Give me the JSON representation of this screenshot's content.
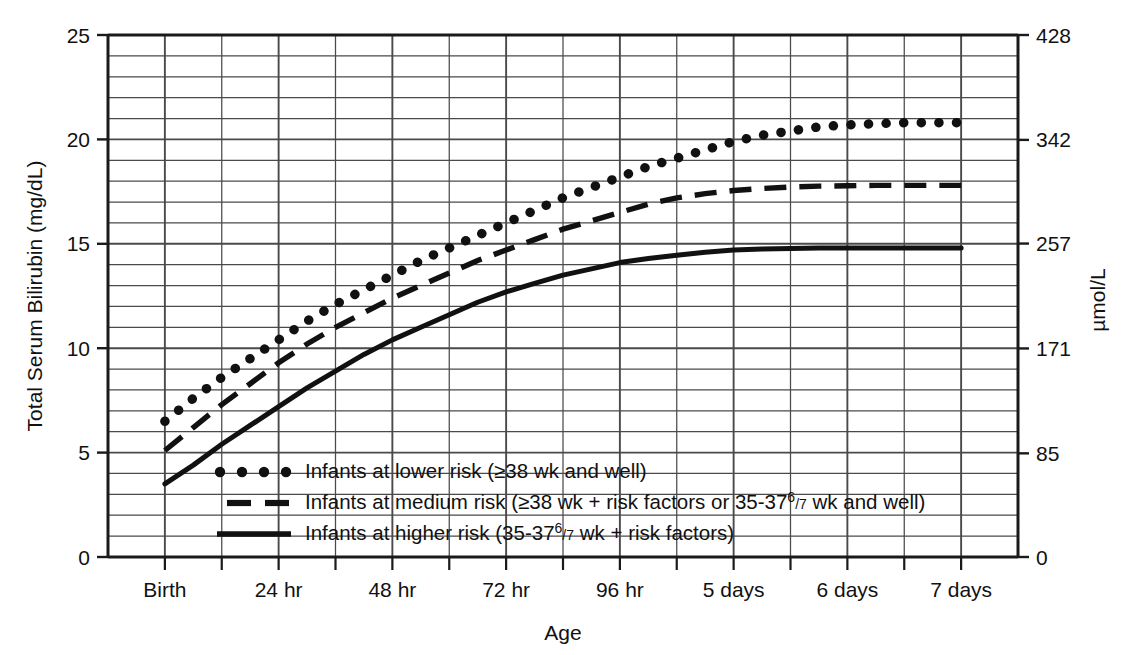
{
  "figure": {
    "background_color": "#ffffff",
    "ink_color": "#111111",
    "grid_color": "#4a4a4a",
    "axis_color": "#1a1a1a"
  },
  "chart_data": {
    "type": "line",
    "title": "",
    "xlabel": "Age",
    "ylabel": "Total Serum Bilirubin (mg/dL)",
    "y2label": "µmol/L",
    "grid": true,
    "legend_position": "inside-bottom-left",
    "xlim": [
      -12,
      180
    ],
    "ylim": [
      0,
      25
    ],
    "y2lim": [
      0,
      428
    ],
    "x_tick_labels": [
      "Birth",
      "24 hr",
      "48 hr",
      "72 hr",
      "96 hr",
      "5 days",
      "6 days",
      "7 days"
    ],
    "x_tick_values": [
      0,
      24,
      48,
      72,
      96,
      120,
      144,
      168
    ],
    "x_minor_step_hours": 12,
    "y_tick_labels": [
      "0",
      "5",
      "10",
      "15",
      "20",
      "25"
    ],
    "y_tick_values": [
      0,
      5,
      10,
      15,
      20,
      25
    ],
    "y_minor_step": 1,
    "y2_tick_labels": [
      "0",
      "85",
      "171",
      "257",
      "342",
      "428"
    ],
    "y2_tick_values": [
      0,
      85,
      171,
      257,
      342,
      428
    ],
    "x": [
      0,
      6,
      12,
      18,
      24,
      30,
      36,
      42,
      48,
      54,
      60,
      66,
      72,
      78,
      84,
      90,
      96,
      102,
      108,
      114,
      120,
      126,
      132,
      138,
      144,
      150,
      156,
      162,
      168
    ],
    "series": [
      {
        "name": "Infants at lower risk (≥38 wk and well)",
        "style": "dotted",
        "key": "lower_risk",
        "values": [
          6.5,
          7.6,
          8.6,
          9.5,
          10.4,
          11.3,
          12.1,
          12.8,
          13.5,
          14.2,
          14.8,
          15.4,
          16.0,
          16.6,
          17.2,
          17.7,
          18.2,
          18.7,
          19.1,
          19.5,
          19.9,
          20.2,
          20.4,
          20.6,
          20.7,
          20.75,
          20.8,
          20.8,
          20.8
        ]
      },
      {
        "name": "Infants at medium risk (≥38 wk + risk factors or 35-37⁶/₇ wk and well)",
        "style": "dashed",
        "key": "medium_risk",
        "values": [
          5.1,
          6.2,
          7.3,
          8.3,
          9.3,
          10.2,
          11.0,
          11.7,
          12.4,
          13.0,
          13.6,
          14.2,
          14.7,
          15.2,
          15.7,
          16.1,
          16.5,
          16.9,
          17.2,
          17.4,
          17.55,
          17.65,
          17.72,
          17.76,
          17.78,
          17.8,
          17.8,
          17.8,
          17.8
        ]
      },
      {
        "name": "Infants at higher risk (35-37⁶/₇ wk + risk factors)",
        "style": "solid",
        "key": "higher_risk",
        "values": [
          3.5,
          4.4,
          5.4,
          6.3,
          7.2,
          8.1,
          8.9,
          9.7,
          10.4,
          11.0,
          11.6,
          12.2,
          12.7,
          13.1,
          13.5,
          13.8,
          14.1,
          14.3,
          14.45,
          14.6,
          14.7,
          14.75,
          14.78,
          14.8,
          14.8,
          14.8,
          14.8,
          14.8,
          14.8
        ]
      }
    ]
  },
  "legend": {
    "entries": [
      {
        "marker": "dotted",
        "prefix": "Infants at lower risk (≥38 wk and well)",
        "has_fraction": false,
        "suffix": ""
      },
      {
        "marker": "dashed",
        "prefix": "Infants at medium risk (≥38 wk + risk factors or 35-37",
        "has_fraction": true,
        "frac_num": "6",
        "frac_den": "7",
        "suffix": " wk and well)"
      },
      {
        "marker": "solid",
        "prefix": "Infants at higher risk (35-37",
        "has_fraction": true,
        "frac_num": "6",
        "frac_den": "7",
        "suffix": " wk + risk factors)"
      }
    ]
  }
}
